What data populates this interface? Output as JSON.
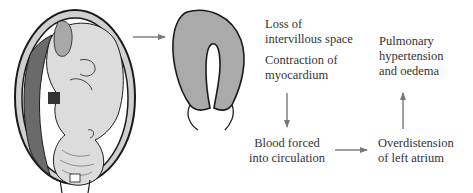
{
  "diagram": {
    "colors": {
      "line": "#1a1a1a",
      "arrow": "#777777",
      "placenta_fill": "#aaaaaa",
      "fetus_fill": "#dcdcdc",
      "uterine_wall_fill": "#c8c8c8",
      "dark_placenta": "#6a6a6a"
    },
    "nodes": {
      "loss": {
        "lines": [
          "Loss of",
          "intervillous space"
        ]
      },
      "contraction": {
        "lines": [
          "Contraction of",
          "myocardium"
        ]
      },
      "blood": {
        "lines": [
          "Blood forced",
          "into circulation"
        ]
      },
      "overdistension": {
        "lines": [
          "Overdistension",
          "of left atrium"
        ]
      },
      "pulmonary": {
        "lines": [
          "Pulmonary",
          "hypertension",
          "and oedema"
        ]
      }
    },
    "arrows": [
      {
        "from": "uterus-illustration",
        "to": "contracted-placenta",
        "direction": "right"
      },
      {
        "from": "contraction",
        "to": "blood",
        "direction": "down"
      },
      {
        "from": "blood",
        "to": "overdistension",
        "direction": "right"
      },
      {
        "from": "overdistension",
        "to": "pulmonary",
        "direction": "up"
      }
    ]
  }
}
